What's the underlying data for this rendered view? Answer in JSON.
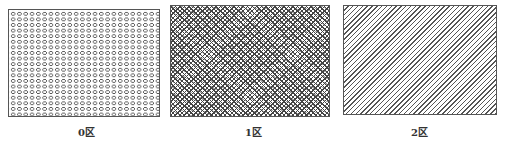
{
  "figure": {
    "panels": [
      {
        "id": "zone0",
        "label": "0区",
        "pattern": "small-circles-grid"
      },
      {
        "id": "zone1",
        "label": "1区",
        "pattern": "cross-hatch"
      },
      {
        "id": "zone2",
        "label": "2区",
        "pattern": "diagonal-hatch"
      }
    ],
    "caption": "",
    "colors": {
      "line": "#555555",
      "background": "#ffffff",
      "text": "#333333"
    }
  }
}
